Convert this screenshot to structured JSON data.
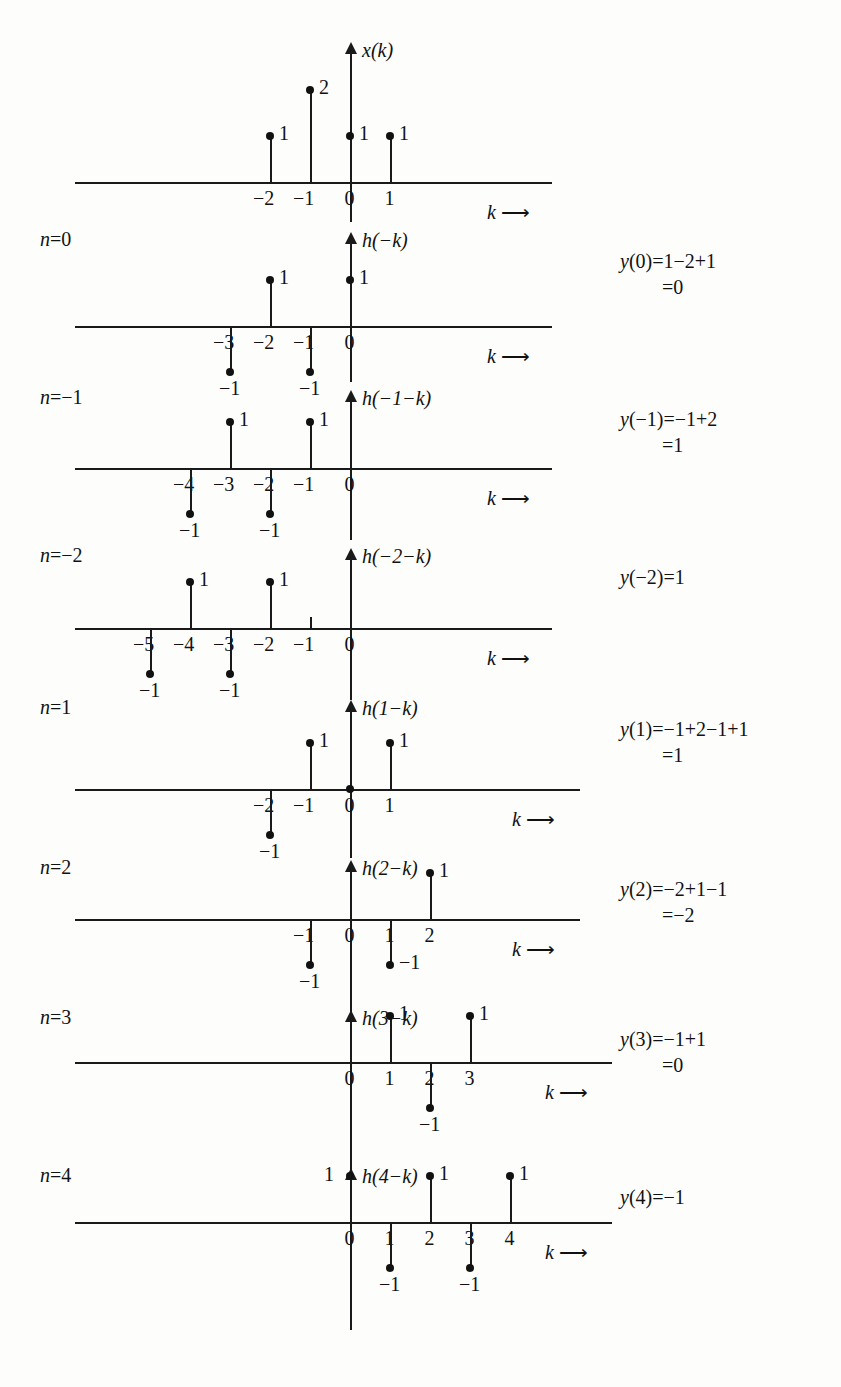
{
  "figure": {
    "type": "discrete-convolution-graphical",
    "k_axis_label": "k",
    "arrow_glyph": "⟶"
  },
  "chart_data": {
    "type": "scatter",
    "title": "",
    "xlabel": "k",
    "ylabel": "",
    "grid": false,
    "legend": "none",
    "panels": [
      {
        "id": "x",
        "signal_label": "x(k)",
        "n_label": "",
        "result_line1": "",
        "result_line2": "",
        "xticks": [
          -2,
          -1,
          0,
          1
        ],
        "x": [
          -2,
          -1,
          0,
          1
        ],
        "values": [
          1,
          2,
          1,
          1
        ],
        "point_labels": [
          "1",
          "2",
          "1",
          "1"
        ]
      },
      {
        "id": "n0",
        "signal_label": "h(−k)",
        "n_label": "n=0",
        "result_line1": "y(0)=1−2+1",
        "result_line2": "=0",
        "xticks": [
          -3,
          -2,
          -1,
          0
        ],
        "x": [
          -3,
          -2,
          -1,
          0
        ],
        "values": [
          -1,
          1,
          -1,
          1
        ],
        "point_labels": [
          "−1",
          "1",
          "−1",
          "1"
        ]
      },
      {
        "id": "nm1",
        "signal_label": "h(−1−k)",
        "n_label": "n=−1",
        "result_line1": "y(−1)=−1+2",
        "result_line2": "=1",
        "xticks": [
          -4,
          -3,
          -2,
          -1,
          0
        ],
        "x": [
          -4,
          -3,
          -2,
          -1
        ],
        "values": [
          -1,
          1,
          -1,
          1
        ],
        "point_labels": [
          "−1",
          "1",
          "−1",
          "1"
        ]
      },
      {
        "id": "nm2",
        "signal_label": "h(−2−k)",
        "n_label": "n=−2",
        "result_line1": "y(−2)=1",
        "result_line2": "",
        "xticks": [
          -5,
          -4,
          -3,
          -2,
          -1,
          0
        ],
        "x": [
          -5,
          -4,
          -3,
          -2
        ],
        "values": [
          -1,
          1,
          -1,
          1
        ],
        "point_labels": [
          "−1",
          "1",
          "−1",
          "1"
        ]
      },
      {
        "id": "n1",
        "signal_label": "h(1−k)",
        "n_label": "n=1",
        "result_line1": "y(1)=−1+2−1+1",
        "result_line2": "=1",
        "xticks": [
          -2,
          -1,
          0,
          1
        ],
        "x": [
          -2,
          -1,
          0,
          1
        ],
        "values": [
          -1,
          1,
          0,
          1
        ],
        "point_labels": [
          "−1",
          "1",
          "",
          "1"
        ]
      },
      {
        "id": "n2",
        "signal_label": "h(2−k)",
        "n_label": "n=2",
        "result_line1": "y(2)=−2+1−1",
        "result_line2": "=−2",
        "xticks": [
          -1,
          0,
          1,
          2
        ],
        "x": [
          -1,
          1,
          2
        ],
        "values": [
          -1,
          -1,
          1
        ],
        "point_labels": [
          "−1",
          "−1",
          "1"
        ]
      },
      {
        "id": "n3",
        "signal_label": "h(3−k)",
        "n_label": "n=3",
        "result_line1": "y(3)=−1+1",
        "result_line2": "=0",
        "xticks": [
          0,
          1,
          2,
          3
        ],
        "x": [
          1,
          2,
          3
        ],
        "values": [
          1,
          -1,
          1
        ],
        "point_labels": [
          "1",
          "−1",
          "1"
        ]
      },
      {
        "id": "n4",
        "signal_label": "h(4−k)",
        "n_label": "n=4",
        "result_line1": "y(4)=−1",
        "result_line2": "",
        "xticks": [
          0,
          1,
          2,
          3,
          4
        ],
        "x": [
          0,
          1,
          2,
          3,
          4
        ],
        "values": [
          1,
          -1,
          1,
          -1,
          1
        ],
        "point_labels": [
          "1",
          "−1",
          "1",
          "−1",
          "1"
        ]
      }
    ]
  }
}
